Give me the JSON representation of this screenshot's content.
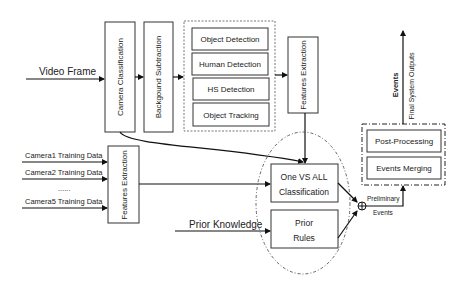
{
  "inputs": {
    "video_frame": "Video Frame",
    "camera1": "Camera1 Training Data",
    "camera2": "Camera2 Training Data",
    "ellipsis": "......",
    "camera5": "Camera5 Training Data",
    "prior_knowledge": "Prior Knowledge"
  },
  "blocks": {
    "camera_classification": "Camera Classification",
    "background_subtraction": "Backgound Subtraction",
    "detection_group": [
      "Object Detection",
      "Human Detection",
      "HS Detection",
      "Object Tracking"
    ],
    "features_extraction_top": "Features Extraction",
    "features_extraction_left": "Features Extraction",
    "one_vs_all_line1": "One VS ALL",
    "one_vs_all_line2": "Classification",
    "prior_rules_line1": "Prior",
    "prior_rules_line2": "Rules",
    "post_processing": "Post-Processing",
    "events_merging": "Events Merging"
  },
  "outputs": {
    "preliminary_line1": "Preliminary",
    "preliminary_line2": "Events",
    "events": "Events",
    "final_outputs": "Final System Outputs"
  }
}
